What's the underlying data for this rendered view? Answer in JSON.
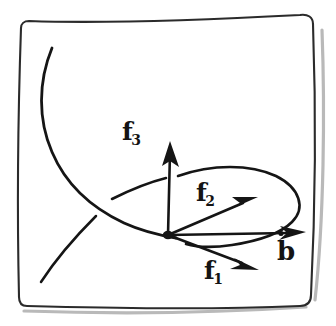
{
  "figure": {
    "kind": "hand-drawn-scanned-diagram",
    "ink_color": "#151515",
    "frame_color": "#2b2b2b",
    "shadow_color": "#b9b9b9",
    "background_color": "#ffffff",
    "border": {
      "name": "hand-drawn-rounded-rectangle",
      "visible": true
    },
    "labels": [
      {
        "id": "f3",
        "base": "f",
        "subscript": "3",
        "describes": "third basis vector, points up"
      },
      {
        "id": "f2",
        "base": "f",
        "subscript": "2",
        "describes": "second basis vector, points up-right"
      },
      {
        "id": "f1",
        "base": "f",
        "subscript": "1",
        "describes": "first basis vector, points down-right"
      },
      {
        "id": "b-doubledot",
        "base": "b",
        "subscript": "",
        "accent": "double-dot",
        "describes": "second time derivative of b, points right"
      }
    ],
    "vectors": [
      {
        "id": "f3",
        "label": "f3",
        "from": "origin",
        "direction": "up"
      },
      {
        "id": "f2",
        "label": "f2",
        "from": "origin",
        "direction": "up-right"
      },
      {
        "id": "f1",
        "label": "f1",
        "from": "origin",
        "direction": "down-right"
      },
      {
        "id": "bddot",
        "label": "b-doubledot",
        "from": "origin",
        "direction": "right"
      }
    ],
    "curves": [
      {
        "id": "trajectory-main",
        "describes": "long curve descending from upper-left through origin region"
      },
      {
        "id": "trajectory-branch",
        "describes": "short arc rising from lower-left to crossing point"
      },
      {
        "id": "orbit-ellipse",
        "describes": "open oval loop around the right side of the frame"
      }
    ],
    "origin": {
      "name": "origin-point",
      "describes": "thick dot where all vectors meet"
    }
  }
}
